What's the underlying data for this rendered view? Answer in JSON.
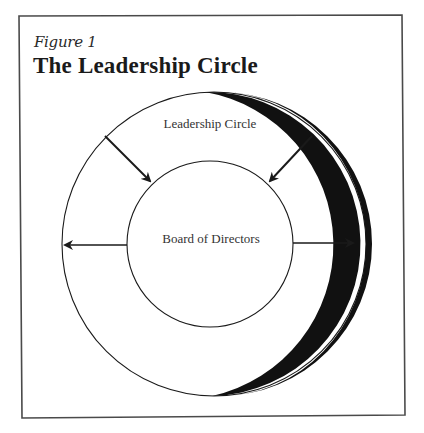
{
  "figure": {
    "label": "Figure 1",
    "title": "The Leadership Circle"
  },
  "diagram": {
    "outer_circle_label": "Leadership Circle",
    "inner_circle_label": "Board of Directors",
    "arrows": [
      {
        "id": "upper-left",
        "direction": "inward",
        "from": "Leadership Circle",
        "to": "Board of Directors"
      },
      {
        "id": "upper-right",
        "direction": "inward",
        "from": "Leadership Circle",
        "to": "Board of Directors"
      },
      {
        "id": "left",
        "direction": "outward",
        "from": "Board of Directors",
        "to": "Leadership Circle"
      },
      {
        "id": "right",
        "direction": "outward",
        "from": "Board of Directors",
        "to": "Leadership Circle"
      }
    ],
    "colors": {
      "stroke": "#1a1a1a",
      "background": "#ffffff",
      "border": "#4a4a4a"
    }
  }
}
